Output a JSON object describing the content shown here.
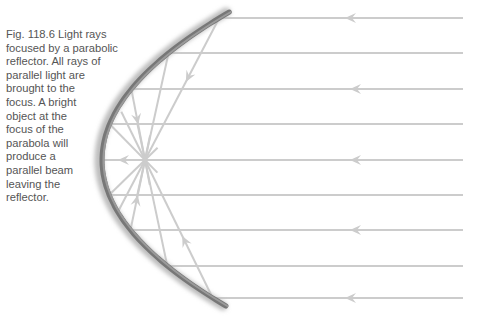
{
  "figure": {
    "label": "Fig. 118.6",
    "caption_lines": [
      "Fig. 118.6   Light rays",
      "focused by a parabolic",
      "reflector. All rays of",
      "parallel light are",
      "brought to the",
      "focus. A bright",
      "object at the",
      "focus of the",
      "parabola will",
      "produce a",
      "parallel beam",
      "leaving the",
      "reflector."
    ]
  },
  "diagram": {
    "type": "parabolic reflector ray diagram",
    "focus": {
      "x": 145,
      "y": 160
    },
    "ray_color": "#cccccc",
    "reflector_color": "#777777",
    "incoming_rays_y": [
      18,
      53,
      89,
      124,
      160,
      195,
      230,
      266,
      298
    ],
    "rays_with_arrows_y": [
      18,
      89,
      160,
      230,
      298
    ]
  }
}
